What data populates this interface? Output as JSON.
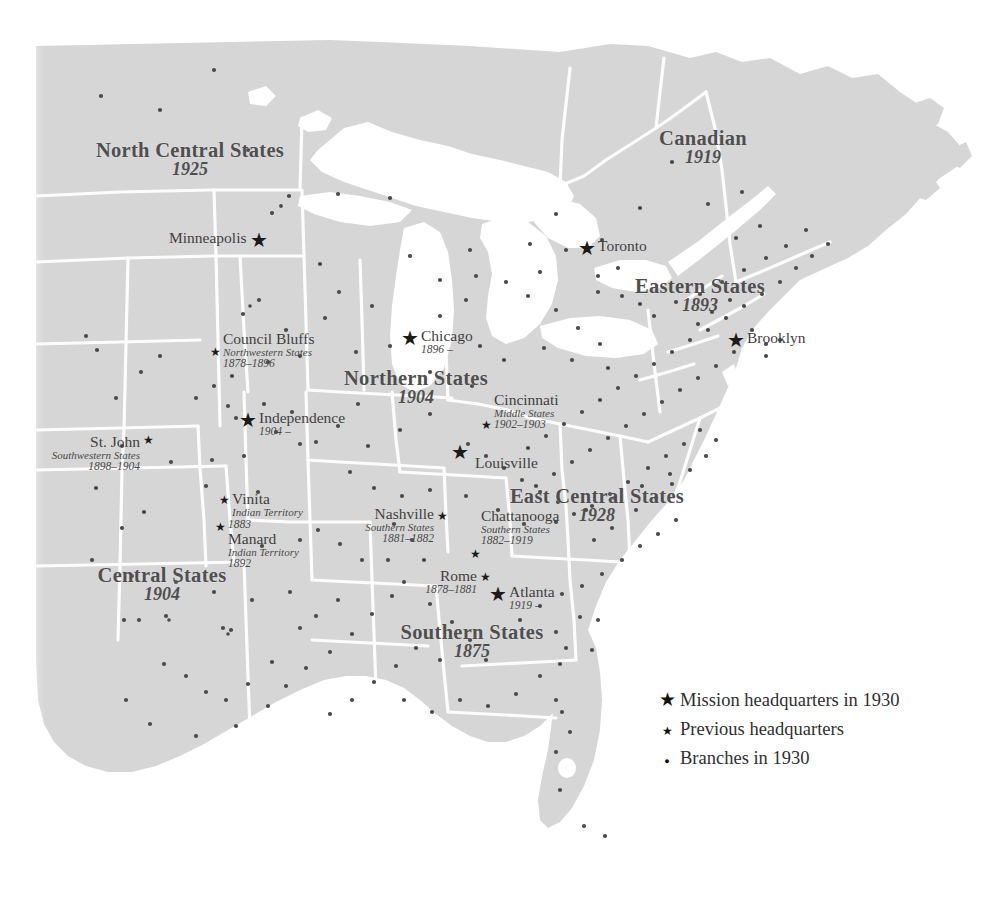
{
  "map": {
    "title": "Mission headquarters and branches map, 1930",
    "land_color": "#d6d6d6",
    "water_color": "#ffffff",
    "border_color": "#ffffff",
    "marker_color": "#1b1b1b",
    "label_color": "#4f4f4f",
    "background_color": "#ffffff"
  },
  "regions": [
    {
      "name": "North Central States",
      "year": "1925",
      "x": 190,
      "y": 152,
      "size": 21
    },
    {
      "name": "Canadian",
      "year": "1919",
      "x": 703,
      "y": 130,
      "size": 21
    },
    {
      "name": "Eastern States",
      "year": "1893",
      "x": 700,
      "y": 278,
      "size": 21
    },
    {
      "name": "Northern States",
      "year": "1904",
      "x": 416,
      "y": 370,
      "size": 21
    },
    {
      "name": "East Central States",
      "year": "1928",
      "x": 597,
      "y": 489,
      "size": 21
    },
    {
      "name": "Central States",
      "year": "1904",
      "x": 162,
      "y": 567,
      "size": 21
    },
    {
      "name": "Southern States",
      "year": "1875",
      "x": 472,
      "y": 624,
      "size": 21
    }
  ],
  "cities": [
    {
      "name": "Minneapolis",
      "sub": "",
      "year": "",
      "marker": "big",
      "side": "left",
      "star_x": 289,
      "star_y": 240
    },
    {
      "name": "Toronto",
      "sub": "",
      "year": "",
      "marker": "big",
      "side": "right",
      "star_x": 587,
      "star_y": 256
    },
    {
      "name": "Brooklyn",
      "sub": "",
      "year": "",
      "marker": "big",
      "side": "right",
      "star_x": 737,
      "star_y": 340
    },
    {
      "name": "Chicago",
      "sub": "",
      "year": "1896 –",
      "marker": "big",
      "side": "right",
      "star_x": 411,
      "star_y": 338
    },
    {
      "name": "Council Bluffs",
      "sub": "Northwestern States",
      "year": "1878–1896",
      "marker": "small",
      "side": "right",
      "star_x": 219,
      "star_y": 352
    },
    {
      "name": "Independence",
      "sub": "",
      "year": "1904 –",
      "marker": "big",
      "side": "right",
      "star_x": 249,
      "star_y": 420
    },
    {
      "name": "St. John",
      "sub": "Southwestern States",
      "year": "1898–1904",
      "marker": "small",
      "side": "left",
      "star_x": 144,
      "star_y": 443
    },
    {
      "name": "Vinita",
      "sub": "Indian Territory",
      "year": "1883",
      "marker": "small",
      "side": "right",
      "star_x": 227,
      "star_y": 500
    },
    {
      "name": "Manard",
      "sub": "Indian Territory",
      "year": "1892",
      "marker": "small",
      "side": "right",
      "star_x": 223,
      "star_y": 528
    },
    {
      "name": "Cincinnati",
      "sub": "Middle States",
      "year": "1902–1903",
      "marker": "small",
      "side": "right",
      "star_x": 489,
      "star_y": 419
    },
    {
      "name": "Louisville",
      "sub": "",
      "year": "",
      "marker": "big",
      "side": "right",
      "star_x": 461,
      "star_y": 452
    },
    {
      "name": "Nashville",
      "sub": "Southern States",
      "year": "1881–1882",
      "marker": "small",
      "side": "left",
      "star_x": 437,
      "star_y": 516
    },
    {
      "name": "Chattanooga",
      "sub": "Southern States",
      "year": "1882–1919",
      "marker": "small",
      "side": "left",
      "star_x": 476,
      "star_y": 548
    },
    {
      "name": "Rome",
      "sub": "",
      "year": "1878–1881",
      "marker": "small",
      "side": "left",
      "star_x": 481,
      "star_y": 577
    },
    {
      "name": "Atlanta",
      "sub": "",
      "year": "1919 –",
      "marker": "big",
      "side": "right",
      "star_x": 499,
      "star_y": 594
    }
  ],
  "legend": {
    "items": [
      {
        "marker": "star-large",
        "label": "Mission headquarters in 1930"
      },
      {
        "marker": "star-small",
        "label": "Previous headquarters"
      },
      {
        "marker": "dot",
        "label": "Branches in 1930"
      }
    ]
  },
  "branches": {
    "count": 176,
    "description": "Small dots marking mission branches in 1930"
  }
}
